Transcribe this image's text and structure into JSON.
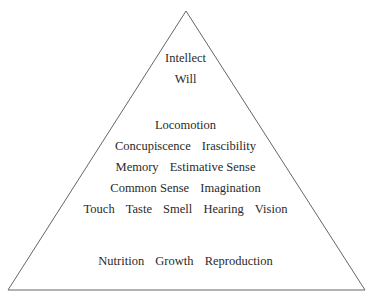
{
  "diagram": {
    "shape": "triangle",
    "line_color": "#555555",
    "tiers": [
      {
        "items": [
          "Intellect"
        ]
      },
      {
        "items": [
          "Will"
        ]
      },
      {
        "items": [
          "Locomotion"
        ]
      },
      {
        "items": [
          "Concupiscence",
          "Irascibility"
        ]
      },
      {
        "items": [
          "Memory",
          "Estimative Sense"
        ]
      },
      {
        "items": [
          "Common Sense",
          "Imagination"
        ]
      },
      {
        "items": [
          "Touch",
          "Taste",
          "Smell",
          "Hearing",
          "Vision"
        ]
      },
      {
        "items": [
          "Nutrition",
          "Growth",
          "Reproduction"
        ]
      }
    ]
  }
}
